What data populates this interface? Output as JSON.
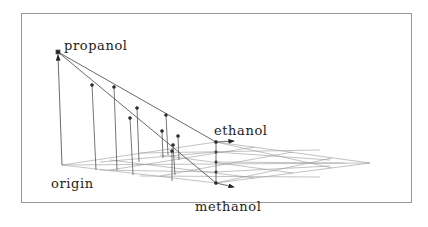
{
  "diagram": {
    "type": "3d-composition-plot",
    "labels": {
      "propanol": "propanol",
      "ethanol": "ethanol",
      "methanol": "methanol",
      "origin": "origin"
    },
    "colors": {
      "frame": "#9a9a9a",
      "lines": "#444444",
      "grid": "#8a8a8a",
      "points": "#222222",
      "text": "#222222"
    },
    "axes": [
      {
        "name": "propanol",
        "direction": "vertical"
      },
      {
        "name": "ethanol",
        "direction": "depth-right"
      },
      {
        "name": "methanol",
        "direction": "front-right"
      }
    ],
    "data_points_count": 9
  }
}
